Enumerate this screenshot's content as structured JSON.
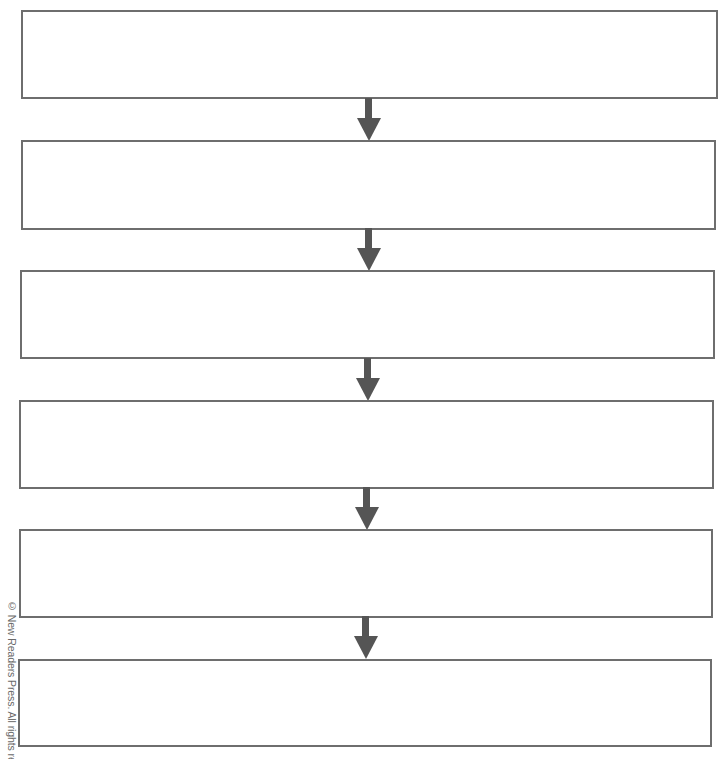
{
  "diagram": {
    "type": "vertical-flowchart",
    "box_count": 6,
    "boxes": [
      {
        "label": ""
      },
      {
        "label": ""
      },
      {
        "label": ""
      },
      {
        "label": ""
      },
      {
        "label": ""
      },
      {
        "label": ""
      }
    ],
    "connector": "down-arrow",
    "colors": {
      "box_border": "#6e6e6e",
      "arrow": "#555555",
      "background": "#ffffff"
    }
  },
  "footer": {
    "copyright": "© New Readers Press. All rights reserved."
  }
}
